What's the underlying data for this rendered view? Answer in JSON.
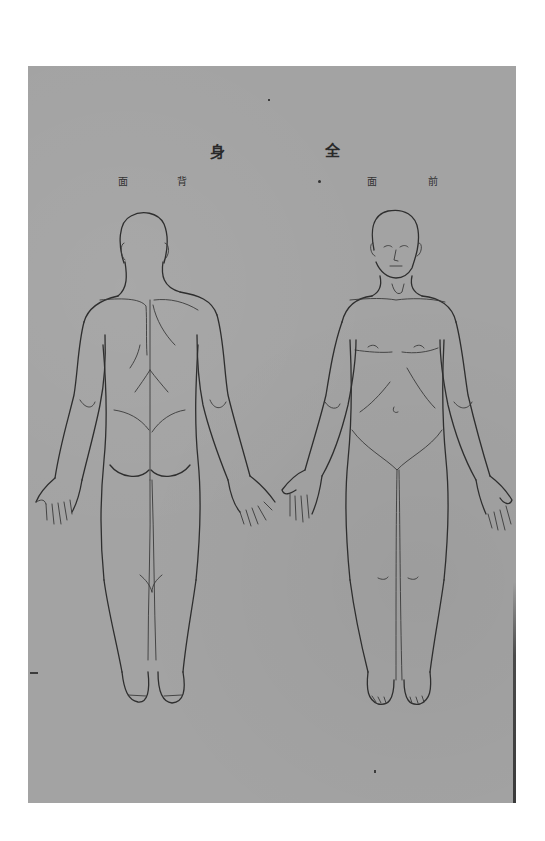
{
  "plate": {
    "title_chars": [
      "身",
      "全"
    ],
    "title_reading": "全身",
    "back_label_chars": [
      "面",
      "背"
    ],
    "back_label_reading": "背面",
    "front_label_chars": [
      "面",
      "前"
    ],
    "front_label_reading": "前面",
    "background_color": "#a3a3a3",
    "line_color": "#2e2e2e"
  },
  "figures": [
    {
      "view": "back",
      "label": "背面"
    },
    {
      "view": "front",
      "label": "前面"
    }
  ]
}
